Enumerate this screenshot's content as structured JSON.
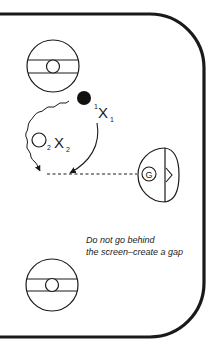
{
  "diagram": {
    "type": "hockey-rink-drill",
    "colors": {
      "ink": "#1a1a1a",
      "background": "#ffffff"
    },
    "players": [
      {
        "id": "x1",
        "label": "X",
        "subscript": "1",
        "superscript": "1",
        "role": "offensive-player-1"
      },
      {
        "id": "x2",
        "label": "X",
        "subscript": "2",
        "role": "offensive-player-2"
      }
    ],
    "markers": [
      {
        "id": "puck-dot",
        "shape": "filled-circle"
      },
      {
        "id": "player2-start",
        "shape": "open-circle",
        "subscript": "2"
      }
    ],
    "goalie": {
      "label": "G"
    },
    "faceoff_circles": 2,
    "note": {
      "line1": "Do not go behind",
      "line2": "the screen–create a gap"
    }
  }
}
